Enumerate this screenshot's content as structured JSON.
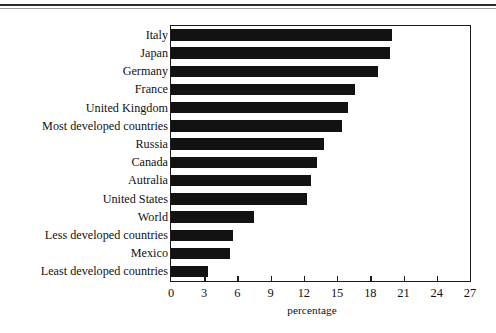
{
  "chart_data": {
    "type": "bar",
    "orientation": "horizontal",
    "title": "",
    "subtitle": "",
    "xlabel": "percentage",
    "ylabel": "",
    "xlim": [
      0,
      27
    ],
    "xticks": [
      0,
      3,
      6,
      9,
      12,
      15,
      18,
      21,
      24,
      27
    ],
    "grid": false,
    "legend": null,
    "bar_color": "#121212",
    "axis_color": "#1a1a1a",
    "categories": [
      "Italy",
      "Japan",
      "Germany",
      "France",
      "United Kingdom",
      "Most developed countries",
      "Russia",
      "Canada",
      "Autralia",
      "United States",
      "World",
      "Less developed countries",
      "Mexico",
      "Least developed countries"
    ],
    "values": [
      20.0,
      19.8,
      18.7,
      16.6,
      16.0,
      15.4,
      13.8,
      13.2,
      12.6,
      12.3,
      7.5,
      5.6,
      5.3,
      3.3
    ]
  }
}
